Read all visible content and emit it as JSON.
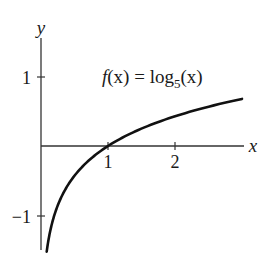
{
  "chart_data": {
    "type": "line",
    "title": "",
    "annotation": "f(x) = log5(x)",
    "function_label": {
      "prefix": "f",
      "arg": "(x)",
      "equals": " = log",
      "base": "5",
      "suffix": "(x)"
    },
    "xlabel": "x",
    "ylabel": "y",
    "x_ticks": [
      1,
      2
    ],
    "x_tick_labels": [
      "1",
      "2"
    ],
    "y_ticks": [
      1,
      -1
    ],
    "y_tick_labels": [
      "1",
      "−1"
    ],
    "xlim": [
      0,
      3.0
    ],
    "ylim": [
      -1.5,
      1.4
    ],
    "grid": false,
    "legend": null,
    "series": [
      {
        "name": "f(x) = log5(x)",
        "x": [
          0.08,
          0.1,
          0.15,
          0.2,
          0.3,
          0.4,
          0.5,
          0.6,
          0.8,
          1.0,
          1.25,
          1.5,
          1.75,
          2.0,
          2.25,
          2.5,
          2.75,
          3.0
        ],
        "values": [
          -1.569,
          -1.431,
          -1.179,
          -1.0,
          -0.748,
          -0.569,
          -0.431,
          -0.317,
          -0.139,
          0.0,
          0.139,
          0.252,
          0.348,
          0.431,
          0.504,
          0.569,
          0.629,
          0.683
        ]
      }
    ],
    "colors": {
      "curve": "#111111",
      "axes": "#333333"
    }
  }
}
